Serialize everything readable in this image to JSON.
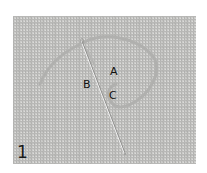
{
  "figure": {
    "step_number": "1",
    "labels": {
      "a": "A",
      "b": "B",
      "c": "C"
    },
    "colors": {
      "background": "#ffffff",
      "fabric": "#c9c9c7",
      "fabric_grid_dark": "#a9a9a7",
      "fabric_grid_light": "#dadad8",
      "thread": "#b3b3b1",
      "needle": "#f2f2f2",
      "needle_shadow": "#8e8e8c",
      "text": "#111111"
    }
  }
}
